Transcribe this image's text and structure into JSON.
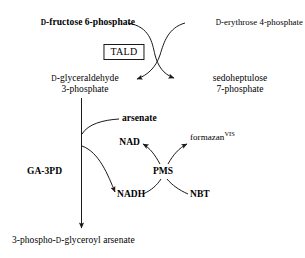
{
  "figure": {
    "type": "biochemical-pathway-diagram",
    "background_color": "#ffffff",
    "stroke_color": "#1a1a1a",
    "text_color": "#000000"
  },
  "nodes": {
    "fructose6p": {
      "prefix": "D",
      "text": "-fructose 6-phosphate"
    },
    "erythrose4p": {
      "prefix": "D",
      "text": "-erythrose 4-phosphate"
    },
    "enzyme_tald": {
      "label": "TALD"
    },
    "gap_line1_prefix": "D",
    "gap_line1": "-glyceraldehyde",
    "gap_line2": "3-phosphate",
    "sedo_line1": "sedoheptulose",
    "sedo_line2": "7-phosphate",
    "arsenate": {
      "label": "arsenate"
    },
    "nad": {
      "label": "NAD"
    },
    "nadh": {
      "label": "NADH"
    },
    "nbt": {
      "label": "NBT"
    },
    "pms": {
      "label": "PMS"
    },
    "formazan": {
      "label": "formazan",
      "superscript": "VIS"
    },
    "ga3pd": {
      "label": "GA-3PD"
    },
    "product": {
      "part1": "3-phospho-",
      "prefix": "D",
      "part2": "-glyceroyl arsenate"
    }
  }
}
